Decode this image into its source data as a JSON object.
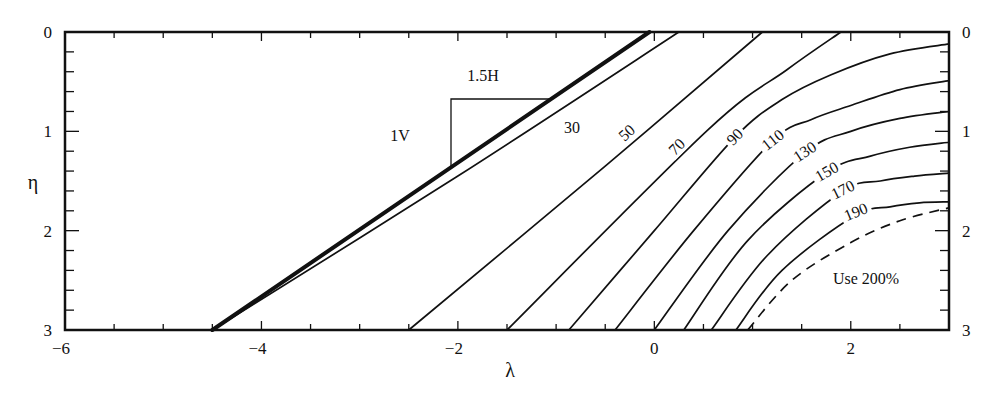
{
  "chart_data": {
    "type": "line",
    "title": "",
    "xlabel": "λ",
    "ylabel": "η",
    "xlim": [
      -6,
      3
    ],
    "ylim": [
      0,
      3
    ],
    "y_inverted": true,
    "grid": false,
    "legend": "none",
    "x_ticks": [
      -6,
      -4,
      -2,
      0,
      2
    ],
    "x_minor_step": 0.5,
    "y_ticks": [
      0,
      1,
      2,
      3
    ],
    "y_minor_step": 0.2,
    "right_y_ticks": [
      0,
      1,
      2,
      3
    ],
    "series": [
      {
        "name": "slope",
        "style": "thick",
        "points": [
          [
            -4.5,
            3
          ],
          [
            -0.05,
            0
          ]
        ]
      },
      {
        "name": "30",
        "label": "30",
        "points": [
          [
            -4.5,
            3
          ],
          [
            -2.0,
            1.45
          ],
          [
            0.25,
            0
          ]
        ]
      },
      {
        "name": "50",
        "label": "50",
        "points": [
          [
            -2.5,
            3
          ],
          [
            -0.5,
            1.35
          ],
          [
            1.1,
            0
          ]
        ]
      },
      {
        "name": "70",
        "label": "70",
        "points": [
          [
            -1.5,
            3
          ],
          [
            0.54,
            0.99
          ],
          [
            1.35,
            0.38
          ],
          [
            1.9,
            0
          ]
        ]
      },
      {
        "name": "90",
        "label": "90",
        "points": [
          [
            -0.87,
            3
          ],
          [
            0.0,
            2.0
          ],
          [
            0.82,
            1.06
          ],
          [
            1.3,
            0.68
          ],
          [
            1.8,
            0.43
          ],
          [
            2.4,
            0.22
          ],
          [
            3.0,
            0.12
          ]
        ]
      },
      {
        "name": "110",
        "label": "110",
        "points": [
          [
            -0.4,
            3
          ],
          [
            0.4,
            2.0
          ],
          [
            1.21,
            1.09
          ],
          [
            1.6,
            0.88
          ],
          [
            2.0,
            0.74
          ],
          [
            2.5,
            0.58
          ],
          [
            3.0,
            0.49
          ]
        ]
      },
      {
        "name": "130",
        "label": "130",
        "points": [
          [
            0.0,
            3
          ],
          [
            0.75,
            2.0
          ],
          [
            1.54,
            1.21
          ],
          [
            2.0,
            1.0
          ],
          [
            2.5,
            0.87
          ],
          [
            3.0,
            0.8
          ]
        ]
      },
      {
        "name": "150",
        "label": "150",
        "points": [
          [
            0.3,
            3
          ],
          [
            0.95,
            2.1
          ],
          [
            1.76,
            1.41
          ],
          [
            2.2,
            1.25
          ],
          [
            2.6,
            1.16
          ],
          [
            3.0,
            1.11
          ]
        ]
      },
      {
        "name": "170",
        "label": "170",
        "points": [
          [
            0.58,
            3
          ],
          [
            1.15,
            2.25
          ],
          [
            1.92,
            1.6
          ],
          [
            2.3,
            1.5
          ],
          [
            2.65,
            1.45
          ],
          [
            3.0,
            1.42
          ]
        ]
      },
      {
        "name": "190",
        "label": "190",
        "points": [
          [
            0.83,
            3
          ],
          [
            1.3,
            2.4
          ],
          [
            2.04,
            1.85
          ],
          [
            2.4,
            1.76
          ],
          [
            2.7,
            1.72
          ],
          [
            3.0,
            1.71
          ]
        ]
      },
      {
        "name": "200",
        "style": "dashed",
        "points": [
          [
            0.95,
            3
          ],
          [
            1.4,
            2.5
          ],
          [
            2.0,
            2.12
          ],
          [
            2.5,
            1.9
          ],
          [
            3.0,
            1.77
          ]
        ]
      }
    ],
    "curve_labels": [
      {
        "text": "30",
        "x": 572,
        "y": 133,
        "rotate": 0
      },
      {
        "text": "50",
        "x": 627,
        "y": 138,
        "rotate": -42
      },
      {
        "text": "70",
        "x": 677,
        "y": 152,
        "rotate": -45
      },
      {
        "text": "90",
        "x": 735,
        "y": 142,
        "rotate": -45
      },
      {
        "text": "110",
        "x": 773,
        "y": 145,
        "rotate": -38
      },
      {
        "text": "130",
        "x": 805,
        "y": 157,
        "rotate": -33
      },
      {
        "text": "150",
        "x": 827,
        "y": 177,
        "rotate": -30
      },
      {
        "text": "170",
        "x": 843,
        "y": 195,
        "rotate": -26
      },
      {
        "text": "190",
        "x": 856,
        "y": 217,
        "rotate": -22
      }
    ],
    "annotations": {
      "slope_h": "1.5H",
      "slope_v": "1V",
      "region": "Use 200%"
    }
  }
}
